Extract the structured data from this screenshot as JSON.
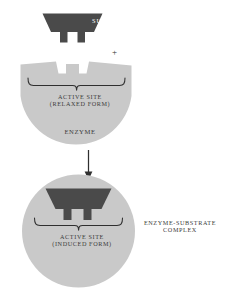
{
  "diagram": {
    "background_color": "#ffffff",
    "colors": {
      "substrate_fill": "#4a4a4a",
      "enzyme_fill": "#c9c9c9",
      "text": "#3b3b3b",
      "substrate_text": "#ffffff",
      "stroke": "#2f2f2f"
    }
  },
  "labels": {
    "substrate": "SUBSTRATE",
    "plus": "+",
    "active_site_relaxed_line1": "ACTIVE SITE",
    "active_site_relaxed_line2": "(RELAXED FORM)",
    "active_site_relaxed": "ACTIVE SITE\n(RELAXED FORM)",
    "enzyme": "ENZYME",
    "active_site_induced_line1": "ACTIVE SITE",
    "active_site_induced_line2": "(INDUCED FORM)",
    "active_site_induced": "ACTIVE SITE\n(INDUCED FORM)",
    "complex_line1": "ENZYME-SUBSTRATE",
    "complex_line2": "COMPLEX",
    "complex": "ENZYME-SUBSTRATE\nCOMPLEX"
  },
  "icons": {
    "substrate_shape": "trapezoid-with-two-prongs",
    "enzyme_top_shape": "notched-circle",
    "enzyme_bottom_shape": "circle",
    "brace_relaxed": "curly-brace-icon",
    "brace_induced": "curly-brace-icon",
    "reaction_arrow": "down-arrow-icon",
    "plus_operator": "plus-icon"
  }
}
